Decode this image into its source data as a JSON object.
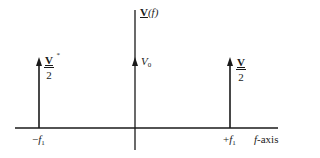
{
  "diagram": {
    "y_axis_label": {
      "symbol": "V",
      "arg": "(f)"
    },
    "x_axis_label": {
      "var": "f",
      "suffix": "-axis"
    },
    "spikes": [
      {
        "position": "-f1",
        "tick_label_sign": "−",
        "tick_label_var": "f",
        "tick_label_sub": "1",
        "amplitude_num": "V",
        "amplitude_sup": "*",
        "amplitude_den": "2"
      },
      {
        "position": "0",
        "amplitude_var": "V",
        "amplitude_sub": "0"
      },
      {
        "position": "+f1",
        "tick_label_sign": "+",
        "tick_label_var": "f",
        "tick_label_sub": "1",
        "amplitude_num": "V",
        "amplitude_den": "2"
      }
    ],
    "colors": {
      "line": "#1a1a1a",
      "background": "#ffffff"
    }
  }
}
